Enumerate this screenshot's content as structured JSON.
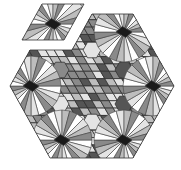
{
  "figure": {
    "colors": {
      "outline": "#333333",
      "dark": "#555555",
      "mid": "#8a8a8a",
      "light": "#bdbdbd",
      "pale": "#e4e4e4",
      "hub": "#1a1a1a",
      "background": "#ffffff"
    },
    "main_outline": [
      [
        30,
        50
      ],
      [
        72,
        50
      ],
      [
        92,
        14
      ],
      [
        133,
        14
      ],
      [
        174,
        86
      ],
      [
        133,
        158
      ],
      [
        50,
        158
      ],
      [
        10,
        86
      ]
    ],
    "detached_piece": [
      [
        42,
        4
      ],
      [
        84,
        4
      ],
      [
        64,
        40
      ],
      [
        22,
        40
      ]
    ],
    "sunburst_centers": [
      [
        124,
        32
      ],
      [
        153,
        86
      ],
      [
        124,
        140
      ],
      [
        62,
        140
      ],
      [
        31,
        86
      ],
      [
        53,
        24
      ]
    ],
    "star_center": [
      92,
      86
    ]
  }
}
